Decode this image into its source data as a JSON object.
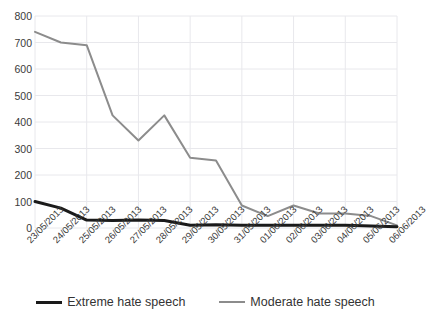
{
  "chart_data": {
    "type": "line",
    "title": "",
    "xlabel": "",
    "ylabel": "",
    "ylim": [
      0,
      800
    ],
    "ytick_step": 100,
    "grid": true,
    "legend_position": "bottom",
    "categories": [
      "23/05/2013",
      "24/05/2013",
      "25/05/2013",
      "26/05/2013",
      "27/05/2013",
      "28/05/2013",
      "29/05/2013",
      "30/05/2013",
      "31/05/2013",
      "01/06/2013",
      "02/06/2013",
      "03/06/2013",
      "04/06/2013",
      "05/06/2013",
      "06/06/2013"
    ],
    "yticks": [
      "0",
      "100",
      "200",
      "300",
      "400",
      "500",
      "600",
      "700",
      "800"
    ],
    "series": [
      {
        "name": "Extreme hate speech",
        "color": "#1a1a1a",
        "width": 3,
        "values": [
          100,
          75,
          30,
          28,
          30,
          28,
          10,
          12,
          10,
          10,
          10,
          10,
          10,
          8,
          5
        ]
      },
      {
        "name": "Moderate hate speech",
        "color": "#8c8c8c",
        "width": 2,
        "values": [
          740,
          700,
          690,
          425,
          330,
          425,
          265,
          255,
          85,
          45,
          85,
          55,
          55,
          45,
          10
        ]
      }
    ]
  },
  "axis": {
    "grid_color": "#e8e8ec"
  }
}
